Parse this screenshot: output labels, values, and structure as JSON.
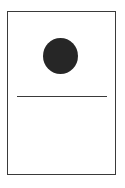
{
  "diagram": {
    "shapes": [
      {
        "type": "rectangle",
        "role": "frame",
        "stroke": "#3a3a3a",
        "fill": "#ffffff"
      },
      {
        "type": "circle",
        "role": "filled-dot",
        "fill": "#262626"
      },
      {
        "type": "line",
        "role": "horizontal-divider",
        "stroke": "#3a3a3a"
      }
    ]
  }
}
